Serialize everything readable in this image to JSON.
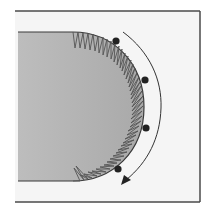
{
  "diagram": {
    "type": "sewing-illustration",
    "colors": {
      "background": "#ffffff",
      "frame_fill": "#f4f4f4",
      "frame_stroke": "#4a4a4a",
      "fabric_fill": "#b8b8b8",
      "fabric_stroke": "#3a3a3a",
      "stitch_stroke": "#555555",
      "dot_fill": "#222222",
      "arrow_stroke": "#333333"
    },
    "pivot_points": 4,
    "arrow_direction": "clockwise-down"
  }
}
